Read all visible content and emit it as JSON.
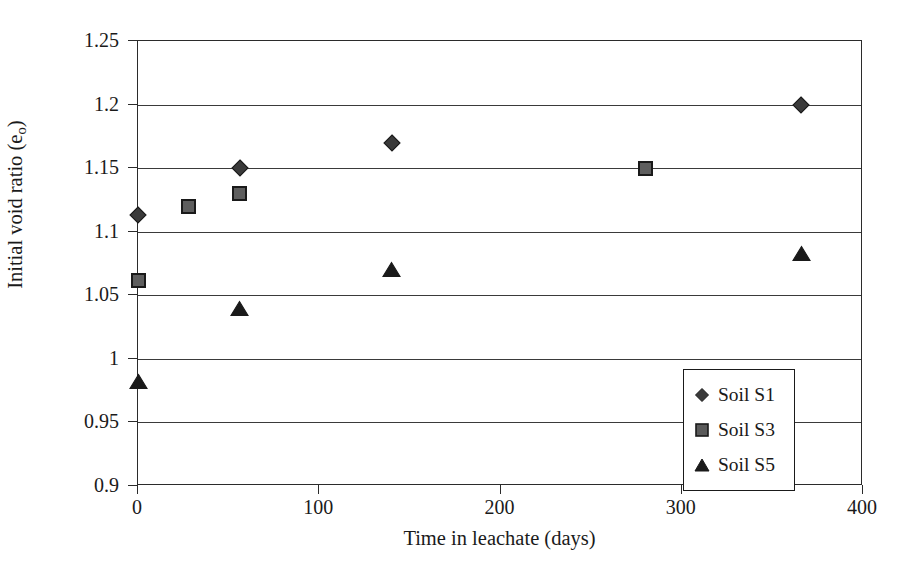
{
  "chart_data": {
    "type": "scatter",
    "title": "",
    "xlabel": "Time in leachate (days)",
    "ylabel": "Initial void ratio (eₒ)",
    "ylabel_main": "Initial void ratio (e",
    "ylabel_sub": "o",
    "ylabel_tail": ")",
    "xlim": [
      0,
      400
    ],
    "ylim": [
      0.9,
      1.25
    ],
    "grid": "horizontal",
    "legend_position": "center-right-inside",
    "x_ticks": [
      {
        "value": 0,
        "label": "0"
      },
      {
        "value": 100,
        "label": "100"
      },
      {
        "value": 200,
        "label": "200"
      },
      {
        "value": 300,
        "label": "300"
      },
      {
        "value": 400,
        "label": "400"
      }
    ],
    "y_ticks": [
      {
        "value": 0.9,
        "label": "0.9"
      },
      {
        "value": 0.95,
        "label": "0.95"
      },
      {
        "value": 1.0,
        "label": "1"
      },
      {
        "value": 1.05,
        "label": "1.05"
      },
      {
        "value": 1.1,
        "label": "1.1"
      },
      {
        "value": 1.15,
        "label": "1.15"
      },
      {
        "value": 1.2,
        "label": "1.2"
      },
      {
        "value": 1.25,
        "label": "1.25"
      }
    ],
    "series": [
      {
        "name": "Soil S1",
        "marker": "diamond",
        "color": "#3a3a3a",
        "points": [
          {
            "x": 0,
            "y": 1.113
          },
          {
            "x": 56,
            "y": 1.15
          },
          {
            "x": 140,
            "y": 1.17
          },
          {
            "x": 366,
            "y": 1.2
          }
        ]
      },
      {
        "name": "Soil S3",
        "marker": "square",
        "color": "#4a4a4a",
        "points": [
          {
            "x": 0,
            "y": 1.062
          },
          {
            "x": 28,
            "y": 1.12
          },
          {
            "x": 56,
            "y": 1.13
          },
          {
            "x": 280,
            "y": 1.15
          }
        ]
      },
      {
        "name": "Soil S5",
        "marker": "triangle",
        "color": "#1a1a1a",
        "points": [
          {
            "x": 0,
            "y": 0.982
          },
          {
            "x": 56,
            "y": 1.04
          },
          {
            "x": 140,
            "y": 1.07
          },
          {
            "x": 366,
            "y": 1.083
          }
        ]
      }
    ]
  },
  "legend": {
    "items": [
      {
        "label": "Soil S1",
        "marker": "diamond"
      },
      {
        "label": "Soil S3",
        "marker": "square"
      },
      {
        "label": "Soil S5",
        "marker": "triangle"
      }
    ]
  }
}
